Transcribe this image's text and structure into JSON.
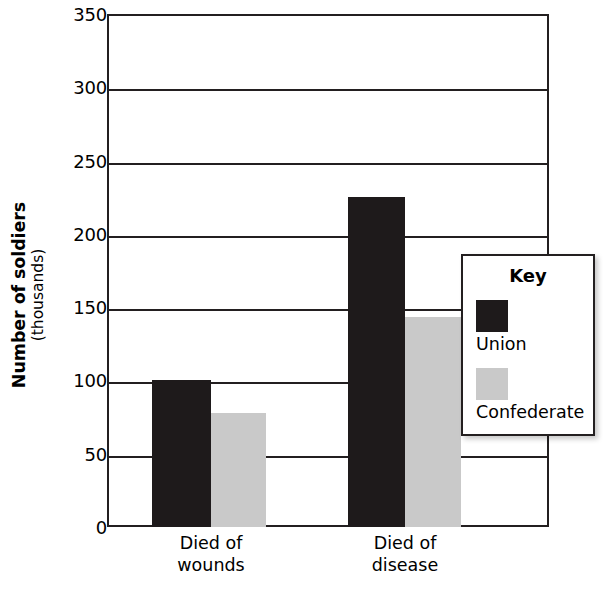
{
  "chart_data": {
    "type": "bar",
    "title": "",
    "subtitle": "",
    "xlabel": "",
    "ylabel": "Number of soldiers (thousands)",
    "ylabel_main": "Number of soldiers",
    "ylabel_sub": "(thousands)",
    "ylim": [
      0,
      350
    ],
    "ytick_labels": [
      "0",
      "50",
      "100",
      "150",
      "200",
      "250",
      "300",
      "350"
    ],
    "ytick_values": [
      0,
      50,
      100,
      150,
      200,
      250,
      300,
      350
    ],
    "grid": true,
    "grid_axis": "y",
    "legend_position": "inside-right",
    "legend_title": "Key",
    "categories": [
      "Died of wounds",
      "Died of disease"
    ],
    "category_lines": [
      [
        "Died of",
        "wounds"
      ],
      [
        "Died of",
        "disease"
      ]
    ],
    "series": [
      {
        "name": "Union",
        "color": "#1e1a1b",
        "values": [
          100,
          225
        ]
      },
      {
        "name": "Confederate",
        "color": "#c9c9c9",
        "values": [
          78,
          143
        ]
      }
    ],
    "axis_color": "#231f20",
    "background_color": "#ffffff"
  }
}
